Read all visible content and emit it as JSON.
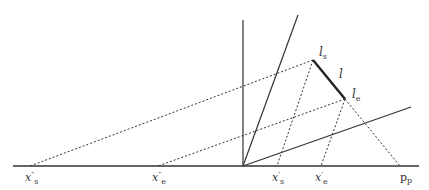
{
  "diagram": {
    "colors": {
      "line": "#333333",
      "background": "#ffffff"
    },
    "axis": {
      "x1": 13,
      "y": 166,
      "x2": 419
    },
    "origin": {
      "x": 243,
      "y": 166
    },
    "solid_lines": [
      {
        "name": "vertical-axis",
        "x1": 243,
        "y1": 166,
        "x2": 243,
        "y2": 20
      },
      {
        "name": "steep-plane-line",
        "x1": 243,
        "y1": 166,
        "x2": 298,
        "y2": 15
      },
      {
        "name": "shallow-plane-line",
        "x1": 243,
        "y1": 166,
        "x2": 411,
        "y2": 107
      }
    ],
    "segment_l": {
      "x1": 313,
      "y1": 60,
      "x2": 345,
      "y2": 99
    },
    "dashed_lines": [
      {
        "name": "ls-to-xpp-s",
        "x1": 313,
        "y1": 60,
        "x2": 30,
        "y2": 166
      },
      {
        "name": "le-to-xpp-e",
        "x1": 345,
        "y1": 99,
        "x2": 158,
        "y2": 166
      },
      {
        "name": "ls-to-xp-s",
        "x1": 313,
        "y1": 60,
        "x2": 277,
        "y2": 166
      },
      {
        "name": "le-to-xp-e",
        "x1": 345,
        "y1": 99,
        "x2": 321,
        "y2": 166
      },
      {
        "name": "le-to-pp",
        "x1": 345,
        "y1": 99,
        "x2": 400,
        "y2": 166
      }
    ],
    "labels": {
      "l_s": {
        "main": "l",
        "sub": "s",
        "x": 319,
        "y": 56
      },
      "l": {
        "main": "l",
        "x": 339,
        "y": 78
      },
      "l_e": {
        "main": "l",
        "sub": "e",
        "x": 352,
        "y": 98
      },
      "xpp_s": {
        "main": "x",
        "prime": "″",
        "sub": "s",
        "x": 25,
        "y": 181
      },
      "xpp_e": {
        "main": "x",
        "prime": "″",
        "sub": "e",
        "x": 152,
        "y": 181
      },
      "xp_s": {
        "main": "x",
        "prime": "′",
        "sub": "s",
        "x": 272,
        "y": 181
      },
      "xp_e": {
        "main": "x",
        "prime": "′",
        "sub": "e",
        "x": 315,
        "y": 181
      },
      "p_p": {
        "main": "p",
        "sub": "p",
        "x": 400,
        "y": 181
      }
    }
  }
}
